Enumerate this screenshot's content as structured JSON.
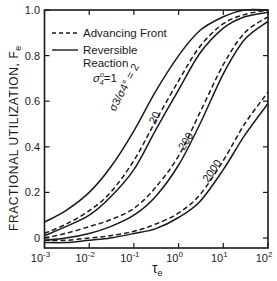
{
  "chart_data": {
    "type": "line",
    "title": "",
    "xlabel": "τe",
    "ylabel": "FRACTIONAL UTILIZATION, Fe",
    "xscale": "log",
    "xlim": [
      0.001,
      100
    ],
    "ylim": [
      -0.02,
      1.0
    ],
    "x_ticks": [
      "10^-3",
      "10^-2",
      "10^-1",
      "10^0",
      "10^1",
      "10^2"
    ],
    "y_ticks": [
      "0",
      "0.2",
      "0.4",
      "0.6",
      "0.8",
      "1.0"
    ],
    "grid": false,
    "legend": {
      "position": "upper-left",
      "entries": [
        {
          "label": "Advancing Front",
          "style": "dashed"
        },
        {
          "label": "Reversible Reaction",
          "style": "solid"
        }
      ],
      "annotation": "σ4° = 1"
    },
    "parameter_label": "σ3°/σ4° = ",
    "x": [
      0.001,
      0.003,
      0.01,
      0.03,
      0.1,
      0.3,
      1,
      3,
      10,
      30,
      100
    ],
    "series": [
      {
        "name": "σ3°/σ4° = 2 (Reversible Reaction)",
        "style": "solid",
        "ratio": "2",
        "values": [
          0.07,
          0.12,
          0.2,
          0.31,
          0.47,
          0.64,
          0.8,
          0.91,
          0.97,
          1.0,
          1.0
        ]
      },
      {
        "name": "20 (Advancing Front)",
        "style": "dashed",
        "ratio": "20",
        "values": [
          0.02,
          0.06,
          0.12,
          0.2,
          0.34,
          0.51,
          0.69,
          0.84,
          0.94,
          0.98,
          1.0
        ]
      },
      {
        "name": "20 (Reversible Reaction)",
        "style": "solid",
        "ratio": "20",
        "values": [
          0.01,
          0.05,
          0.1,
          0.18,
          0.3,
          0.47,
          0.65,
          0.81,
          0.92,
          0.97,
          0.99
        ]
      },
      {
        "name": "200 (Advancing Front)",
        "style": "dashed",
        "ratio": "200",
        "values": [
          0.0,
          0.02,
          0.05,
          0.08,
          0.13,
          0.22,
          0.36,
          0.55,
          0.76,
          0.9,
          0.97
        ]
      },
      {
        "name": "200 (Reversible Reaction)",
        "style": "solid",
        "ratio": "200",
        "values": [
          -0.01,
          0.0,
          0.02,
          0.05,
          0.1,
          0.18,
          0.32,
          0.5,
          0.72,
          0.87,
          0.95
        ]
      },
      {
        "name": "2000 (Advancing Front)",
        "style": "dashed",
        "ratio": "2000",
        "values": [
          -0.01,
          -0.01,
          0.0,
          0.01,
          0.03,
          0.06,
          0.11,
          0.19,
          0.34,
          0.5,
          0.64
        ]
      },
      {
        "name": "2000 (Reversible Reaction)",
        "style": "solid",
        "ratio": "2000",
        "values": [
          -0.02,
          -0.02,
          -0.01,
          0.0,
          0.02,
          0.04,
          0.09,
          0.16,
          0.3,
          0.45,
          0.59
        ]
      }
    ],
    "curve_labels": [
      {
        "text": "σ3°/σ4° = 2",
        "x": 0.12,
        "y": 0.55
      },
      {
        "text": "20",
        "x": 0.55,
        "y": 0.52
      },
      {
        "text": "200",
        "x": 3.5,
        "y": 0.48
      },
      {
        "text": "2000",
        "x": 15,
        "y": 0.38
      }
    ]
  },
  "labels": {
    "y_axis_main": "FRACTIONAL UTILIZATION, F",
    "y_axis_sub": "e",
    "x_axis_main": "τ",
    "x_axis_sub": "e",
    "legend_dashed": "Advancing Front",
    "legend_solid_line1": "Reversible",
    "legend_solid_line2": "Reaction",
    "sigma4_label": "σ",
    "sigma4_sup": "o",
    "sigma4_sub": "4",
    "sigma4_value": "=1",
    "curve_2_label": "σ3/σ4° = 2",
    "curve_20_label": "20",
    "curve_200_label": "200",
    "curve_2000_label": "2000"
  }
}
